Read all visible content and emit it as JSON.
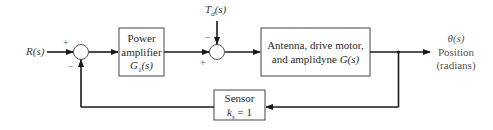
{
  "diagram": {
    "type": "block-diagram",
    "input": {
      "label": "R(s)"
    },
    "disturbance": {
      "label": "T_d(s)",
      "label_main": "T",
      "label_sub": "d",
      "label_rest": "(s)"
    },
    "summing_junctions": [
      {
        "id": "sum1",
        "signs": {
          "top": "+",
          "bottom": "−"
        }
      },
      {
        "id": "sum2",
        "signs": {
          "top": "−",
          "bottom": "+"
        }
      }
    ],
    "blocks": [
      {
        "id": "power-amplifier",
        "lines": [
          "Power",
          "amplifier",
          "G₁(s)"
        ],
        "line1": "Power",
        "line2": "amplifier",
        "line3_main": "G",
        "line3_sub": "1",
        "line3_rest": "(s)"
      },
      {
        "id": "plant",
        "lines": [
          "Antenna, drive motor,",
          "and amplidyne G(s)"
        ],
        "line1": "Antenna, drive motor,",
        "line2_text": "and amplidyne ",
        "line2_ital": "G(s)"
      },
      {
        "id": "sensor",
        "lines": [
          "Sensor",
          "k_s = 1"
        ],
        "line1": "Sensor",
        "line2_main": "k",
        "line2_sub": "s",
        "line2_rest": " = 1"
      }
    ],
    "output": {
      "symbol": "θ(s)",
      "line1": "Position",
      "line2": "(radians)"
    },
    "colors": {
      "line": "#1a1a1a",
      "box_border": "#333333",
      "text": "#333333"
    }
  }
}
